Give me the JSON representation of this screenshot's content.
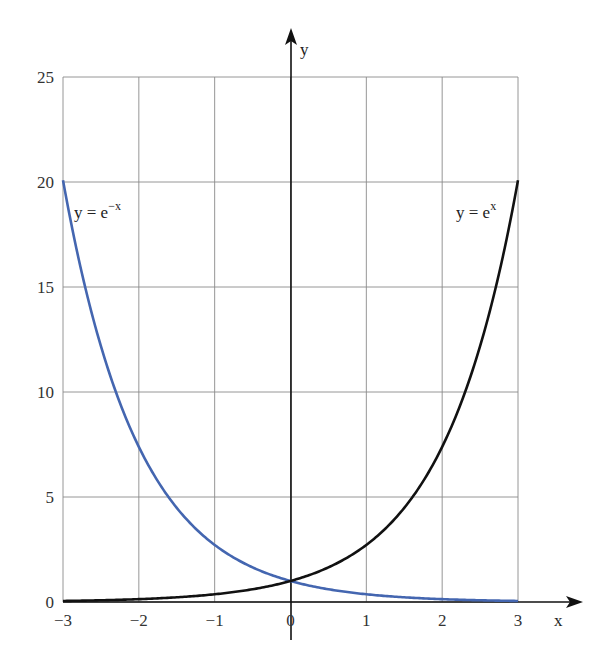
{
  "chart_data": {
    "type": "line",
    "title": "",
    "xlabel": "x",
    "ylabel": "y",
    "xlim": [
      -3,
      3
    ],
    "ylim": [
      0,
      25
    ],
    "grid": true,
    "x_ticks": [
      "−3",
      "−2",
      "−1",
      "0",
      "1",
      "2",
      "3"
    ],
    "y_ticks": [
      "0",
      "5",
      "10",
      "15",
      "20",
      "25"
    ],
    "series": [
      {
        "name": "y = e^x",
        "label_text": "y = e",
        "label_sup": "x",
        "color": "#111111",
        "x": [
          -3,
          -2,
          -1,
          0,
          1,
          2,
          3
        ],
        "values": [
          0.05,
          0.14,
          0.37,
          1,
          2.72,
          7.39,
          20.09
        ]
      },
      {
        "name": "y = e^-x",
        "label_text": "y = e",
        "label_sup": "−x",
        "color": "#4466b0",
        "x": [
          -3,
          -2,
          -1,
          0,
          1,
          2,
          3
        ],
        "values": [
          20.09,
          7.39,
          2.72,
          1,
          0.37,
          0.14,
          0.05
        ]
      }
    ]
  }
}
